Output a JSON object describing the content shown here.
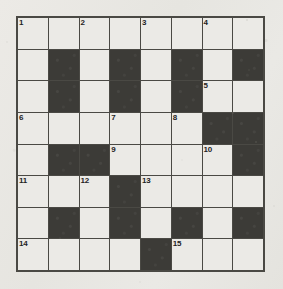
{
  "puzzle": {
    "title": "Crossword Grid",
    "rows": 8,
    "columns": 8,
    "colors": {
      "paper": "#e9e8e4",
      "open_cell": "#ebeae6",
      "block_cell": "#3c3b37",
      "grid_line": "#4a4944",
      "number_text": "#24231f"
    },
    "legend": {
      "open": "open letter square",
      "block": "filled black square"
    },
    "grid": [
      [
        {
          "type": "open",
          "number": "1"
        },
        {
          "type": "open",
          "number": ""
        },
        {
          "type": "open",
          "number": "2"
        },
        {
          "type": "open",
          "number": ""
        },
        {
          "type": "open",
          "number": "3"
        },
        {
          "type": "open",
          "number": ""
        },
        {
          "type": "open",
          "number": "4"
        },
        {
          "type": "open",
          "number": ""
        }
      ],
      [
        {
          "type": "open",
          "number": ""
        },
        {
          "type": "block",
          "number": ""
        },
        {
          "type": "open",
          "number": ""
        },
        {
          "type": "block",
          "number": ""
        },
        {
          "type": "open",
          "number": ""
        },
        {
          "type": "block",
          "number": ""
        },
        {
          "type": "open",
          "number": ""
        },
        {
          "type": "block",
          "number": ""
        }
      ],
      [
        {
          "type": "open",
          "number": ""
        },
        {
          "type": "block",
          "number": ""
        },
        {
          "type": "open",
          "number": ""
        },
        {
          "type": "block",
          "number": ""
        },
        {
          "type": "open",
          "number": ""
        },
        {
          "type": "block",
          "number": ""
        },
        {
          "type": "open",
          "number": "5"
        },
        {
          "type": "open",
          "number": ""
        }
      ],
      [
        {
          "type": "open",
          "number": "6"
        },
        {
          "type": "open",
          "number": ""
        },
        {
          "type": "open",
          "number": ""
        },
        {
          "type": "open",
          "number": "7"
        },
        {
          "type": "open",
          "number": ""
        },
        {
          "type": "open",
          "number": "8"
        },
        {
          "type": "block",
          "number": ""
        },
        {
          "type": "block",
          "number": ""
        }
      ],
      [
        {
          "type": "open",
          "number": ""
        },
        {
          "type": "block",
          "number": ""
        },
        {
          "type": "block",
          "number": ""
        },
        {
          "type": "open",
          "number": "9"
        },
        {
          "type": "open",
          "number": ""
        },
        {
          "type": "open",
          "number": ""
        },
        {
          "type": "open",
          "number": "10"
        },
        {
          "type": "block",
          "number": ""
        }
      ],
      [
        {
          "type": "open",
          "number": "11"
        },
        {
          "type": "open",
          "number": ""
        },
        {
          "type": "open",
          "number": "12"
        },
        {
          "type": "block",
          "number": ""
        },
        {
          "type": "open",
          "number": "13"
        },
        {
          "type": "open",
          "number": ""
        },
        {
          "type": "open",
          "number": ""
        },
        {
          "type": "open",
          "number": ""
        }
      ],
      [
        {
          "type": "open",
          "number": ""
        },
        {
          "type": "block",
          "number": ""
        },
        {
          "type": "open",
          "number": ""
        },
        {
          "type": "block",
          "number": ""
        },
        {
          "type": "open",
          "number": ""
        },
        {
          "type": "block",
          "number": ""
        },
        {
          "type": "open",
          "number": ""
        },
        {
          "type": "block",
          "number": ""
        }
      ],
      [
        {
          "type": "open",
          "number": "14"
        },
        {
          "type": "open",
          "number": ""
        },
        {
          "type": "open",
          "number": ""
        },
        {
          "type": "open",
          "number": ""
        },
        {
          "type": "block",
          "number": ""
        },
        {
          "type": "open",
          "number": "15"
        },
        {
          "type": "open",
          "number": ""
        },
        {
          "type": "open",
          "number": ""
        }
      ]
    ]
  }
}
